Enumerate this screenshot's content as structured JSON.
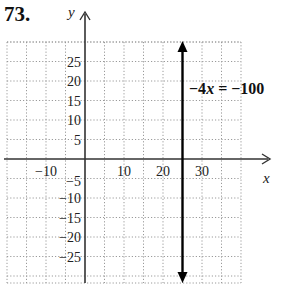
{
  "problem": {
    "number": "73."
  },
  "chart_data": {
    "type": "line",
    "title": "",
    "xlabel": "x",
    "ylabel": "y",
    "xlim": [
      -20,
      40
    ],
    "ylim": [
      -32,
      30
    ],
    "grid": true,
    "grid_step": 5,
    "x_tick_labels": [
      "−10",
      "10",
      "20",
      "30"
    ],
    "x_ticks": [
      -10,
      10,
      20,
      30
    ],
    "y_tick_labels": [
      "25",
      "20",
      "15",
      "10",
      "5",
      "−5",
      "−10",
      "−15",
      "−20",
      "−25"
    ],
    "y_ticks": [
      25,
      20,
      15,
      10,
      5,
      -5,
      -10,
      -15,
      -20,
      -25
    ],
    "series": [
      {
        "name": "−4x = −100",
        "type": "vertical-line",
        "x": 25,
        "arrows": "both"
      }
    ],
    "annotations": [
      {
        "text": "−4x = −100",
        "x": 26,
        "y": 18
      }
    ]
  },
  "labels": {
    "x_axis": "x",
    "y_axis": "y",
    "equation": {
      "left": "−4",
      "var": "x",
      "right": " = −100"
    }
  },
  "colors": {
    "grid": "#9a9a9a",
    "axis": "#333333",
    "line": "#000000"
  }
}
